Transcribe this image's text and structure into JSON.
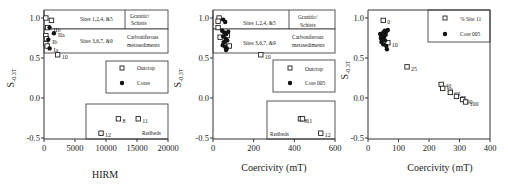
{
  "chart_data": [
    {
      "type": "scatter",
      "title": "",
      "xlabel": "HIRM",
      "ylabel": "S-0.3T",
      "xlim": [
        0,
        20000
      ],
      "ylim": [
        -0.5,
        1.1
      ],
      "xticks": [
        0,
        5000,
        10000,
        15000,
        20000
      ],
      "yticks": [
        -0.5,
        0.0,
        0.5,
        1.0
      ],
      "xtick_labels": [
        "0",
        "5000",
        "10000",
        "15000",
        "20000"
      ],
      "ytick_labels": [
        "-0.5",
        "0.0",
        "0.5",
        "1.0"
      ],
      "regions": [
        {
          "label": "Sites 1,2,4, &5",
          "category": "Granitic/ Schists"
        },
        {
          "label": "Sites 3,6,7, &9",
          "category": "Carboniferous metasediments"
        },
        {
          "label": "Redbeds"
        }
      ],
      "legend": [
        {
          "marker": "open-square",
          "label": "Outcrop"
        },
        {
          "marker": "filled-circle",
          "label": "Cores"
        }
      ],
      "series": [
        {
          "name": "Outcrop",
          "marker": "open-square",
          "points": [
            {
              "x": 300,
              "y": 1.0
            },
            {
              "x": 1200,
              "y": 0.97
            },
            {
              "x": 600,
              "y": 0.88
            },
            {
              "x": 300,
              "y": 0.78
            },
            {
              "x": 400,
              "y": 0.74
            },
            {
              "x": 300,
              "y": 0.68
            },
            {
              "x": 500,
              "y": 0.65
            },
            {
              "x": 2200,
              "y": 0.54,
              "label": "10"
            },
            {
              "x": 12000,
              "y": -0.26,
              "label": "8"
            },
            {
              "x": 15200,
              "y": -0.26,
              "label": "11"
            },
            {
              "x": 9200,
              "y": -0.44,
              "label": "12"
            }
          ]
        },
        {
          "name": "Cores",
          "marker": "filled-circle",
          "points": [
            {
              "x": 900,
              "y": 0.88,
              "label": "IIb"
            },
            {
              "x": 1600,
              "y": 0.81,
              "label": "IIa"
            },
            {
              "x": 700,
              "y": 0.73,
              "label": "Ib"
            },
            {
              "x": 900,
              "y": 0.62,
              "label": "Ia"
            }
          ]
        }
      ]
    },
    {
      "type": "scatter",
      "title": "",
      "xlabel": "Coercivity  (mT)",
      "ylabel": "S-0.3T",
      "xlim": [
        0,
        600
      ],
      "ylim": [
        -0.5,
        1.1
      ],
      "xticks": [
        0,
        200,
        400,
        600
      ],
      "yticks": [
        -0.5,
        0.0,
        0.5,
        1.0
      ],
      "xtick_labels": [
        "0",
        "200",
        "400",
        "600"
      ],
      "ytick_labels": [
        "-0.5",
        "0.0",
        "0.5",
        "1.0"
      ],
      "regions": [
        {
          "label": "Sites 1,2,4, &5",
          "category": "Granitic/ Schists"
        },
        {
          "label": "Sites 3,6,7, &9",
          "category": "Carboniferous metasediments"
        },
        {
          "label": "Redbeds"
        }
      ],
      "legend": [
        {
          "marker": "open-square",
          "label": "Outcrop"
        },
        {
          "marker": "filled-circle",
          "label": "Core 005"
        }
      ],
      "series": [
        {
          "name": "Outcrop",
          "marker": "open-square",
          "points": [
            {
              "x": 30,
              "y": 1.0
            },
            {
              "x": 25,
              "y": 0.96
            },
            {
              "x": 25,
              "y": 0.88
            },
            {
              "x": 35,
              "y": 0.76
            },
            {
              "x": 55,
              "y": 0.68
            },
            {
              "x": 70,
              "y": 0.78
            },
            {
              "x": 80,
              "y": 0.65
            },
            {
              "x": 235,
              "y": 0.54,
              "label": "10"
            },
            {
              "x": 430,
              "y": -0.26,
              "label": "8"
            },
            {
              "x": 440,
              "y": -0.26,
              "label": "11"
            },
            {
              "x": 530,
              "y": -0.44,
              "label": "12"
            }
          ]
        },
        {
          "name": "Core 005",
          "marker": "filled-circle",
          "points": [
            {
              "x": 50,
              "y": 0.98
            },
            {
              "x": 60,
              "y": 0.95
            },
            {
              "x": 45,
              "y": 0.84
            },
            {
              "x": 55,
              "y": 0.82
            },
            {
              "x": 65,
              "y": 0.8
            },
            {
              "x": 75,
              "y": 0.83
            },
            {
              "x": 50,
              "y": 0.77
            },
            {
              "x": 62,
              "y": 0.74
            },
            {
              "x": 70,
              "y": 0.72
            },
            {
              "x": 55,
              "y": 0.7
            },
            {
              "x": 48,
              "y": 0.66
            },
            {
              "x": 60,
              "y": 0.64
            },
            {
              "x": 68,
              "y": 0.62
            },
            {
              "x": 64,
              "y": 0.6
            }
          ]
        }
      ]
    },
    {
      "type": "scatter",
      "title": "",
      "xlabel": "Coercivity  (mT)",
      "ylabel": "S-0.3T",
      "xlim": [
        0,
        400
      ],
      "ylim": [
        -0.5,
        1.1
      ],
      "xticks": [
        0,
        100,
        200,
        300,
        400
      ],
      "yticks": [
        -0.5,
        0.0,
        0.5,
        1.0
      ],
      "xtick_labels": [
        "0",
        "100",
        "200",
        "300",
        "400"
      ],
      "ytick_labels": [
        "-0.5",
        "0.0",
        "0.5",
        "1.0"
      ],
      "legend": [
        {
          "marker": "open-square",
          "label": "% Site 11"
        },
        {
          "marker": "filled-circle",
          "label": "Core 005"
        }
      ],
      "series": [
        {
          "name": "% Site 11",
          "marker": "open-square",
          "points": [
            {
              "x": 50,
              "y": 0.97,
              "label": "0"
            },
            {
              "x": 65,
              "y": 0.69,
              "label": "10"
            },
            {
              "x": 128,
              "y": 0.39,
              "label": "25"
            },
            {
              "x": 240,
              "y": 0.17,
              "label": "40"
            },
            {
              "x": 245,
              "y": 0.12,
              "label": "50"
            },
            {
              "x": 270,
              "y": 0.07,
              "label": "60"
            },
            {
              "x": 290,
              "y": 0.02,
              "label": "75"
            },
            {
              "x": 310,
              "y": -0.02,
              "label": "90"
            },
            {
              "x": 320,
              "y": -0.05,
              "label": "100"
            }
          ]
        },
        {
          "name": "Core 005",
          "marker": "filled-circle",
          "points": [
            {
              "x": 40,
              "y": 0.8
            },
            {
              "x": 45,
              "y": 0.78
            },
            {
              "x": 50,
              "y": 0.82
            },
            {
              "x": 55,
              "y": 0.84
            },
            {
              "x": 60,
              "y": 0.83
            },
            {
              "x": 65,
              "y": 0.85
            },
            {
              "x": 42,
              "y": 0.75
            },
            {
              "x": 48,
              "y": 0.73
            },
            {
              "x": 52,
              "y": 0.76
            },
            {
              "x": 58,
              "y": 0.79
            },
            {
              "x": 44,
              "y": 0.7
            },
            {
              "x": 50,
              "y": 0.67
            },
            {
              "x": 56,
              "y": 0.72
            },
            {
              "x": 60,
              "y": 0.65
            },
            {
              "x": 62,
              "y": 0.61
            }
          ]
        }
      ]
    }
  ]
}
